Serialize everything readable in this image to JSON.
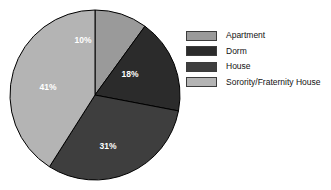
{
  "chart_data": {
    "type": "pie",
    "title": "",
    "categories": [
      "Apartment",
      "Dorm",
      "House",
      "Sorority/Fraternity House"
    ],
    "values": [
      10,
      18,
      31,
      41
    ],
    "value_labels": [
      "10%",
      "18%",
      "31%",
      "41%"
    ],
    "colors": [
      "#9a9a9a",
      "#2b2b2b",
      "#3e3e3e",
      "#b4b4b4"
    ],
    "start_angle_deg": 0,
    "direction": "clockwise",
    "legend_position": "right",
    "grid": false,
    "unit": "%"
  },
  "pie": {
    "center_x": 95,
    "center_y": 95,
    "radius": 85,
    "outline_color": "#000000",
    "slices": [
      {
        "label": "Apartment",
        "value": 10,
        "display": "10%",
        "color": "#9a9a9a",
        "label_x": 83,
        "label_y": 41
      },
      {
        "label": "Dorm",
        "value": 18,
        "display": "18%",
        "color": "#2b2b2b",
        "label_x": 130,
        "label_y": 75
      },
      {
        "label": "House",
        "value": 31,
        "display": "31%",
        "color": "#3e3e3e",
        "label_x": 108,
        "label_y": 147
      },
      {
        "label": "Sorority/Fraternity House",
        "value": 41,
        "display": "41%",
        "color": "#b4b4b4",
        "label_x": 48,
        "label_y": 88
      }
    ]
  },
  "legend": {
    "items": [
      {
        "label": "Apartment",
        "color": "#9a9a9a"
      },
      {
        "label": "Dorm",
        "color": "#2b2b2b"
      },
      {
        "label": "House",
        "color": "#3e3e3e"
      },
      {
        "label": "Sorority/Fraternity House",
        "color": "#b4b4b4"
      }
    ]
  }
}
